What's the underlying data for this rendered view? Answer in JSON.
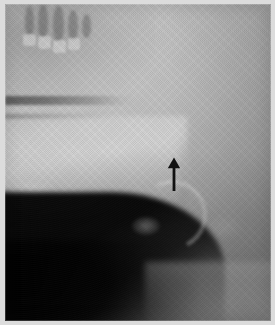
{
  "figure": {
    "domain": "Natural-Image",
    "modality": "radiograph",
    "view": "lateral",
    "caption": "",
    "width_px": 275,
    "height_px": 325,
    "border_color": "#dcdcdc",
    "film_base_color": "#8d8d8d"
  },
  "annotations": {
    "arrow": {
      "label": "",
      "glyph": "arrow-up",
      "color": "#111111",
      "x_px": 174,
      "y_tip_px": 158,
      "y_tail_px": 190,
      "direction": "up"
    }
  },
  "regions": [
    {
      "name": "maxilla-and-tooth-roots",
      "label": "",
      "tone": "bright"
    },
    {
      "name": "hard-palate-band",
      "label": "",
      "tone": "dark-line"
    },
    {
      "name": "mandible-body",
      "label": "",
      "tone": "bright"
    },
    {
      "name": "oropharyngeal-air-shadow",
      "label": "",
      "tone": "black"
    },
    {
      "name": "epiglottis-arc",
      "label": "",
      "tone": "bright-arc"
    },
    {
      "name": "cervical-soft-tissue",
      "label": "",
      "tone": "mid-grey"
    }
  ],
  "teeth": [
    {
      "name": "root-1",
      "left_px": 20,
      "top_px": 2,
      "w_px": 9,
      "h_px": 30
    },
    {
      "name": "root-2",
      "left_px": 33,
      "top_px": 0,
      "w_px": 10,
      "h_px": 34
    },
    {
      "name": "root-3",
      "left_px": 48,
      "top_px": 2,
      "w_px": 11,
      "h_px": 36
    },
    {
      "name": "root-4",
      "left_px": 63,
      "top_px": 6,
      "w_px": 10,
      "h_px": 30
    },
    {
      "name": "root-5",
      "left_px": 77,
      "top_px": 10,
      "w_px": 9,
      "h_px": 24
    }
  ],
  "crowns": [
    {
      "name": "crown-1",
      "left_px": 18,
      "top_px": 30,
      "w_px": 13,
      "h_px": 12
    },
    {
      "name": "crown-2",
      "left_px": 33,
      "top_px": 32,
      "w_px": 13,
      "h_px": 13
    },
    {
      "name": "crown-3",
      "left_px": 48,
      "top_px": 36,
      "w_px": 13,
      "h_px": 13
    },
    {
      "name": "crown-4",
      "left_px": 63,
      "top_px": 34,
      "w_px": 12,
      "h_px": 12
    }
  ]
}
